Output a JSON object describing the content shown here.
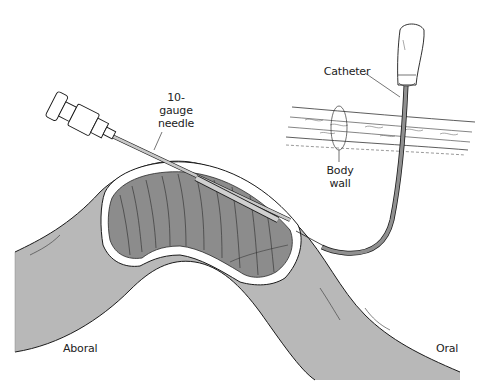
{
  "figure": {
    "type": "medical-illustration",
    "colors": {
      "background": "#ffffff",
      "tube_outer": "#b8b8b8",
      "tube_inner": "#8c8c8c",
      "catheter": "#909090",
      "outline": "#1a1a1a",
      "needle": "#c8c8c8"
    }
  },
  "labels": {
    "needle": {
      "line1": "10-",
      "line2": "gauge",
      "line3": "needle"
    },
    "catheter": "Catheter",
    "body_wall": {
      "line1": "Body",
      "line2": "wall"
    },
    "aboral": "Aboral",
    "oral": "Oral"
  }
}
